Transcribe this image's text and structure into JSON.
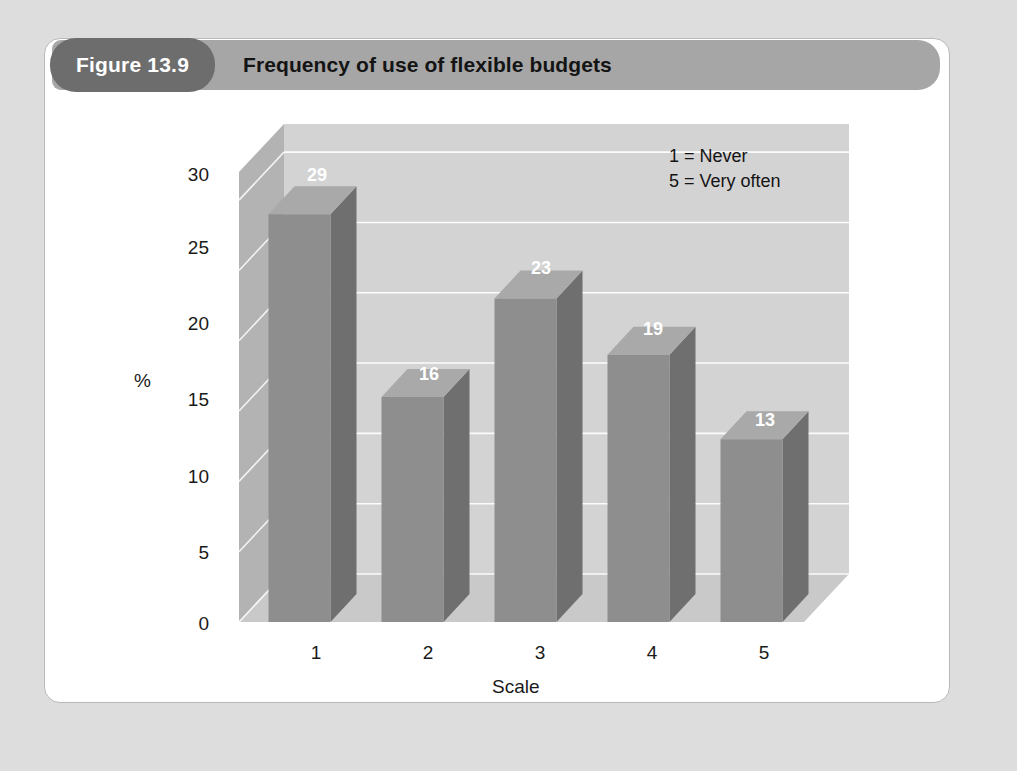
{
  "header": {
    "figure_badge": "Figure 13.9",
    "title": "Frequency of use of flexible budgets"
  },
  "colors": {
    "page_background": "#dddddd",
    "card_background": "#ffffff",
    "card_border": "#b9b9b9",
    "badge_fill": "#6d6d6d",
    "title_bar_fill": "#a6a6a6",
    "bar_front": "#8e8e8e",
    "bar_side": "#6f6f6f",
    "bar_top": "#a9a9a9",
    "back_wall": "#d3d3d3",
    "left_wall": "#b3b3b3",
    "floor": "#c9c9c9",
    "gridline": "#ffffff",
    "text": "#141414",
    "value_text": "#ffffff"
  },
  "chart_data": {
    "type": "bar",
    "title": "Frequency of use of flexible budgets",
    "xlabel": "Scale",
    "ylabel": "%",
    "categories": [
      "1",
      "2",
      "3",
      "4",
      "5"
    ],
    "values": [
      29,
      16,
      23,
      19,
      13
    ],
    "yticks": [
      0,
      5,
      10,
      15,
      20,
      25,
      30
    ],
    "ylim": [
      0,
      32
    ],
    "grid": true,
    "legend_position": "top-right",
    "annotations": [
      "1 = Never",
      "5 = Very often"
    ],
    "style": "3d-column"
  },
  "legend": {
    "line1": "1 = Never",
    "line2": "5 = Very often"
  },
  "axis": {
    "y_title": "%",
    "x_title": "Scale",
    "yticks": [
      "0",
      "5",
      "10",
      "15",
      "20",
      "25",
      "30"
    ],
    "xticks": [
      "1",
      "2",
      "3",
      "4",
      "5"
    ]
  },
  "bar_labels": [
    "29",
    "16",
    "23",
    "19",
    "13"
  ]
}
